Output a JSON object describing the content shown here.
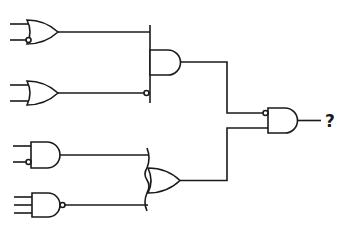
{
  "diagram": {
    "type": "logic-circuit",
    "output_label": "?",
    "gates": [
      {
        "id": "g1",
        "type": "OR",
        "inputs": 2,
        "inverted_inputs": [
          2
        ],
        "output_inverted": false
      },
      {
        "id": "g2",
        "type": "OR",
        "inputs": 2,
        "inverted_inputs": [],
        "output_inverted": false
      },
      {
        "id": "g3",
        "type": "AND",
        "inputs": 2,
        "inverted_inputs": [
          2
        ],
        "output_inverted": false
      },
      {
        "id": "g4",
        "type": "NAND",
        "inputs": 3,
        "inverted_inputs": [],
        "output_inverted": true
      },
      {
        "id": "g5",
        "type": "AND",
        "inputs": "g1, NOT g2",
        "inverted_inputs": [
          2
        ],
        "output_inverted": false
      },
      {
        "id": "g6",
        "type": "OR",
        "inputs": "g3, g4",
        "inverted_inputs": [],
        "output_inverted": false
      },
      {
        "id": "g7",
        "type": "AND",
        "inputs": "NOT g5, g6",
        "inverted_inputs": [
          1
        ],
        "output_inverted": false
      }
    ],
    "stroke_color": "#1a1a1a",
    "background": "#ffffff"
  }
}
